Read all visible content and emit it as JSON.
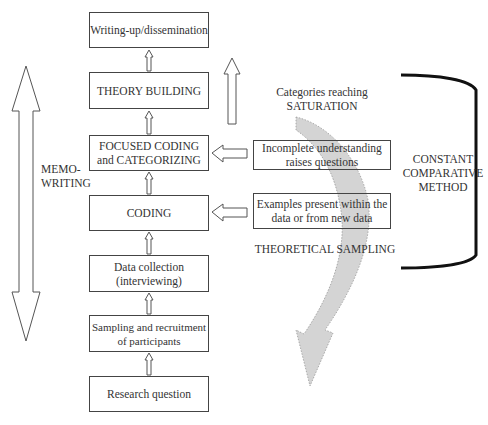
{
  "flowchart": {
    "steps": [
      {
        "id": "writing-up",
        "label": "Writing-up/dissemination"
      },
      {
        "id": "theory-building",
        "label": "THEORY BUILDING"
      },
      {
        "id": "focused-coding",
        "label_line1": "FOCUSED CODING",
        "label_line2": "and CATEGORIZING"
      },
      {
        "id": "coding",
        "label": "CODING"
      },
      {
        "id": "data-collection",
        "label_line1": "Data collection",
        "label_line2": "(interviewing)"
      },
      {
        "id": "sampling",
        "label_line1": "Sampling and recruitment",
        "label_line2": "of participants"
      },
      {
        "id": "research-question",
        "label": "Research question"
      }
    ],
    "flow_direction": "bottom-to-top"
  },
  "memo_writing": {
    "label_line1": "MEMO-",
    "label_line2": "WRITING",
    "arrow": "double-headed-vertical"
  },
  "feedback": {
    "incomplete": {
      "label_line1": "Incomplete understanding",
      "label_line2": "raises questions",
      "points_to": "focused-coding"
    },
    "examples": {
      "label_line1": "Examples present within the",
      "label_line2": "data or from new data",
      "points_to": "coding"
    }
  },
  "annotations": {
    "saturation_line1": "Categories reaching",
    "saturation_line2": "SATURATION",
    "theoretical_sampling": "THEORETICAL SAMPLING"
  },
  "bracket": {
    "label_line1": "CONSTANT",
    "label_line2": "COMPARATIVE",
    "label_line3": "METHOD"
  },
  "colors": {
    "line": "#444444",
    "curved_arrow_fill": "#d4d4d4",
    "bracket": "#111111"
  }
}
